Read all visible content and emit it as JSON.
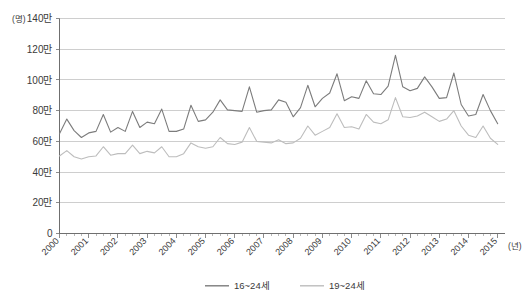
{
  "chart_data": {
    "type": "line",
    "title": "",
    "subtitle": "",
    "xlabel": "(년)",
    "ylabel": "(명)",
    "y_unit_suffix": "만",
    "ylim": [
      0,
      1400000
    ],
    "xlim": [
      2000,
      2015.25
    ],
    "grid": true,
    "legend_position": "bottom-center",
    "y_ticks": [
      0,
      200000,
      400000,
      600000,
      800000,
      1000000,
      1200000,
      1400000
    ],
    "y_tick_labels": [
      "0",
      "20만",
      "40만",
      "60만",
      "80만",
      "100만",
      "120만",
      "140만"
    ],
    "x_ticks": [
      2000,
      2001,
      2002,
      2003,
      2004,
      2005,
      2006,
      2007,
      2008,
      2009,
      2010,
      2011,
      2012,
      2013,
      2014,
      2015
    ],
    "x_tick_labels": [
      "2000",
      "2001",
      "2002",
      "2003",
      "2004",
      "2005",
      "2006",
      "2007",
      "2008",
      "2009",
      "2010",
      "2011",
      "2012",
      "2013",
      "2014",
      "2015"
    ],
    "x_minor_ticks_per_interval": 4,
    "x_values": [
      2000.0,
      2000.25,
      2000.5,
      2000.75,
      2001.0,
      2001.25,
      2001.5,
      2001.75,
      2002.0,
      2002.25,
      2002.5,
      2002.75,
      2003.0,
      2003.25,
      2003.5,
      2003.75,
      2004.0,
      2004.25,
      2004.5,
      2004.75,
      2005.0,
      2005.25,
      2005.5,
      2005.75,
      2006.0,
      2006.25,
      2006.5,
      2006.75,
      2007.0,
      2007.25,
      2007.5,
      2007.75,
      2008.0,
      2008.25,
      2008.5,
      2008.75,
      2009.0,
      2009.25,
      2009.5,
      2009.75,
      2010.0,
      2010.25,
      2010.5,
      2010.75,
      2011.0,
      2011.25,
      2011.5,
      2011.75,
      2012.0,
      2012.25,
      2012.5,
      2012.75,
      2013.0,
      2013.25,
      2013.5,
      2013.75,
      2014.0,
      2014.25,
      2014.5,
      2014.75,
      2015.0
    ],
    "series": [
      {
        "name": "16~24세",
        "color": "#7c7c7c",
        "values": [
          650000,
          745000,
          670000,
          625000,
          655000,
          665000,
          775000,
          660000,
          690000,
          665000,
          795000,
          690000,
          725000,
          715000,
          810000,
          665000,
          665000,
          680000,
          835000,
          730000,
          740000,
          790000,
          870000,
          805000,
          800000,
          795000,
          955000,
          790000,
          800000,
          805000,
          870000,
          855000,
          760000,
          820000,
          965000,
          825000,
          880000,
          915000,
          1040000,
          865000,
          890000,
          880000,
          995000,
          910000,
          905000,
          960000,
          1160000,
          955000,
          930000,
          945000,
          1020000,
          955000,
          880000,
          885000,
          1045000,
          840000,
          765000,
          775000,
          905000,
          800000,
          715000
        ]
      },
      {
        "name": "19~24세",
        "color": "#bdbdbd",
        "values": [
          505000,
          540000,
          500000,
          485000,
          500000,
          505000,
          565000,
          510000,
          520000,
          520000,
          575000,
          520000,
          535000,
          525000,
          565000,
          500000,
          500000,
          520000,
          590000,
          565000,
          555000,
          565000,
          625000,
          585000,
          580000,
          595000,
          690000,
          600000,
          595000,
          590000,
          610000,
          585000,
          590000,
          620000,
          700000,
          640000,
          665000,
          690000,
          780000,
          690000,
          695000,
          680000,
          775000,
          725000,
          715000,
          740000,
          885000,
          760000,
          755000,
          765000,
          790000,
          760000,
          730000,
          745000,
          800000,
          700000,
          640000,
          625000,
          700000,
          620000,
          580000
        ]
      }
    ],
    "legend": [
      {
        "label": "16~24세",
        "color": "#7c7c7c"
      },
      {
        "label": "19~24세",
        "color": "#bdbdbd"
      }
    ]
  },
  "colors": {
    "background": "#ffffff",
    "grid": "#b9b9b9",
    "axis": "#6f6f6f",
    "text": "#3a3a3a",
    "series_dark": "#7c7c7c",
    "series_light": "#bdbdbd"
  }
}
